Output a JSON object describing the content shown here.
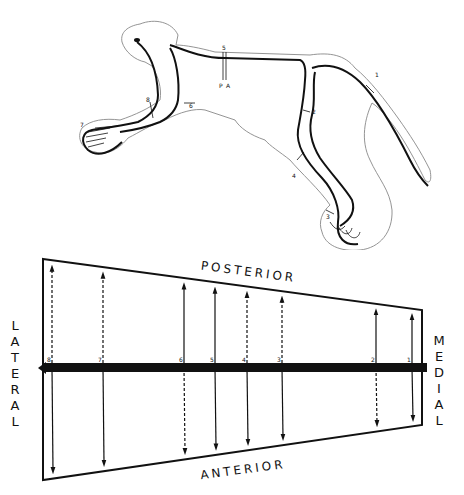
{
  "figure": {
    "top": {
      "description": "Monkey body outline with dermatome/line markers",
      "markers": [
        "1",
        "2",
        "3",
        "4",
        "5",
        "6",
        "7",
        "8"
      ],
      "small_labels": [
        "A",
        "P"
      ]
    },
    "bottom": {
      "labels": {
        "top": "POSTERIOR",
        "bottom": "ANTERIOR",
        "left": "LATERAL",
        "right": "MEDIAL"
      },
      "lines": [
        {
          "id": "8",
          "x": 52,
          "top_style": "dashed",
          "bottom_style": "solid"
        },
        {
          "id": "7",
          "x": 103,
          "top_style": "dashed",
          "bottom_style": "solid"
        },
        {
          "id": "6",
          "x": 184,
          "top_style": "solid",
          "bottom_style": "dashed"
        },
        {
          "id": "5",
          "x": 215,
          "top_style": "solid",
          "bottom_style": "solid"
        },
        {
          "id": "4",
          "x": 247,
          "top_style": "dashed",
          "bottom_style": "solid"
        },
        {
          "id": "3",
          "x": 282,
          "top_style": "dashed",
          "bottom_style": "solid"
        },
        {
          "id": "2",
          "x": 376,
          "top_style": "solid",
          "bottom_style": "dashed"
        },
        {
          "id": "1",
          "x": 412,
          "top_style": "solid",
          "bottom_style": "solid"
        }
      ]
    },
    "colors": {
      "ink": "#111111",
      "outline": "#888888",
      "background": "#ffffff"
    }
  }
}
